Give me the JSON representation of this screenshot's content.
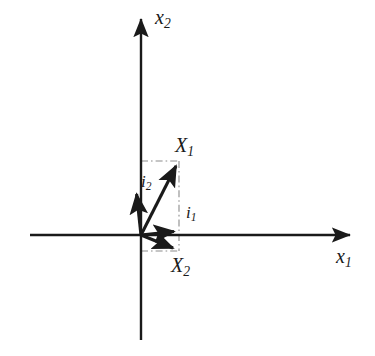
{
  "figure": {
    "type": "vector-diagram",
    "title": "",
    "background_color": "#ffffff",
    "stroke_color": "#1a1a1a",
    "guide_color": "#8c8c8c"
  },
  "axes": {
    "x_axis": {
      "name": "horizontal-axis",
      "label": "x",
      "label_sub": "1",
      "label_full": "x1",
      "from": [
        30,
        235
      ],
      "to": [
        356,
        235
      ],
      "arrow": "end"
    },
    "y_axis": {
      "name": "vertical-axis",
      "label": "x",
      "label_sub": "2",
      "label_full": "x2",
      "from": [
        141,
        340
      ],
      "to": [
        141,
        13
      ],
      "arrow": "end"
    },
    "origin": [
      141,
      235
    ]
  },
  "vectors": [
    {
      "id": "X1",
      "label": "X",
      "label_sub": "1",
      "label_full": "X1",
      "from": [
        141,
        235
      ],
      "to": [
        178,
        161
      ],
      "description": "resultant vector into first quadrant"
    },
    {
      "id": "i2",
      "label": "i",
      "label_sub": "2",
      "label_full": "i2",
      "from": [
        141,
        235
      ],
      "to": [
        136,
        188
      ],
      "description": "basis vector tilted slightly left of vertical"
    },
    {
      "id": "i1",
      "label": "i",
      "label_sub": "1",
      "label_full": "i1",
      "from": [
        141,
        235
      ],
      "to": [
        180,
        231
      ],
      "description": "basis vector nearly along positive horizontal axis"
    },
    {
      "id": "X2",
      "label": "X",
      "label_sub": "2",
      "label_full": "X2",
      "from": [
        141,
        235
      ],
      "to": [
        178,
        251
      ],
      "description": "vector into fourth quadrant, below horizontal axis"
    }
  ],
  "guides": [
    {
      "id": "guide-top-horizontal",
      "style": "dash-dot",
      "from": [
        141,
        161
      ],
      "to": [
        179,
        161
      ]
    },
    {
      "id": "guide-right-vertical",
      "style": "dash-dot",
      "from": [
        179,
        161
      ],
      "to": [
        179,
        251
      ]
    },
    {
      "id": "guide-bottom-horizontal",
      "style": "dash-dot",
      "from": [
        141,
        251
      ],
      "to": [
        179,
        251
      ]
    }
  ],
  "labels": {
    "x_axis": "x",
    "x_axis_sub": "1",
    "y_axis": "x",
    "y_axis_sub": "2",
    "X1": "X",
    "X1_sub": "1",
    "X2": "X",
    "X2_sub": "2",
    "i1": "i",
    "i1_sub": "1",
    "i2": "i",
    "i2_sub": "2"
  }
}
